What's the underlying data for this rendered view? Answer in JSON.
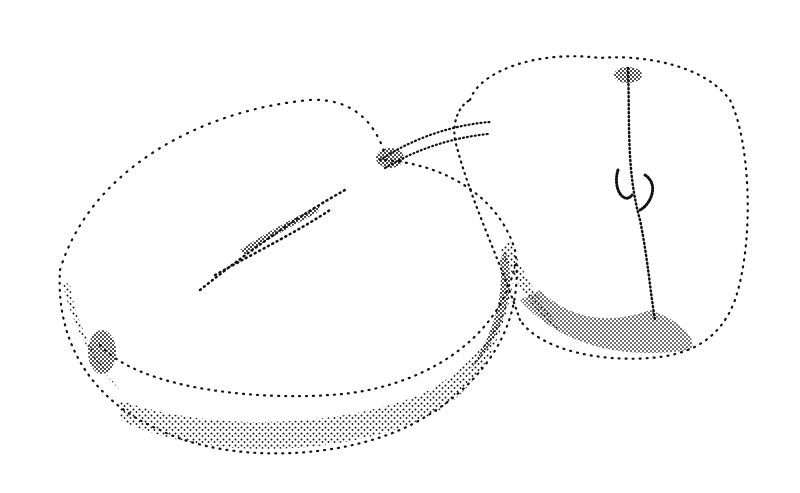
{
  "image": {
    "alt": "Stipple ink illustration of two halved plums",
    "background_color": "#ffffff",
    "ink_color": "#111111",
    "subjects": [
      {
        "name": "left-fruit-half",
        "description": "large horizontally lying plum half showing cut face with pit groove"
      },
      {
        "name": "right-fruit-half",
        "description": "upright plum half showing crease and stem end"
      }
    ]
  }
}
